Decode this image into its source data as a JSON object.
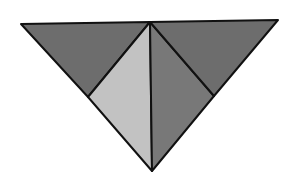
{
  "diagram": {
    "type": "triangle-dissection",
    "colors": {
      "background": "#ffffff",
      "dark_gray": "#6d6d6d",
      "light_gray": "#c2c2c2",
      "mid_gray": "#787878",
      "stroke": "#111111"
    },
    "vertices": {
      "top_left": [
        21,
        24
      ],
      "top_center": [
        150,
        22
      ],
      "top_right": [
        278,
        20
      ],
      "bottom": [
        152,
        171
      ],
      "left_mid": [
        88,
        97
      ],
      "right_mid": [
        214,
        96
      ]
    },
    "pieces": [
      {
        "name": "top-left-piece",
        "fill": "dark_gray",
        "points": [
          "top_left",
          "top_center",
          "left_mid"
        ]
      },
      {
        "name": "center-left-piece",
        "fill": "light_gray",
        "points": [
          "left_mid",
          "top_center",
          "bottom"
        ]
      },
      {
        "name": "center-right-piece",
        "fill": "mid_gray",
        "points": [
          "top_center",
          "right_mid",
          "bottom"
        ]
      },
      {
        "name": "top-right-piece",
        "fill": "dark_gray",
        "points": [
          "top_center",
          "top_right",
          "right_mid"
        ]
      }
    ]
  }
}
